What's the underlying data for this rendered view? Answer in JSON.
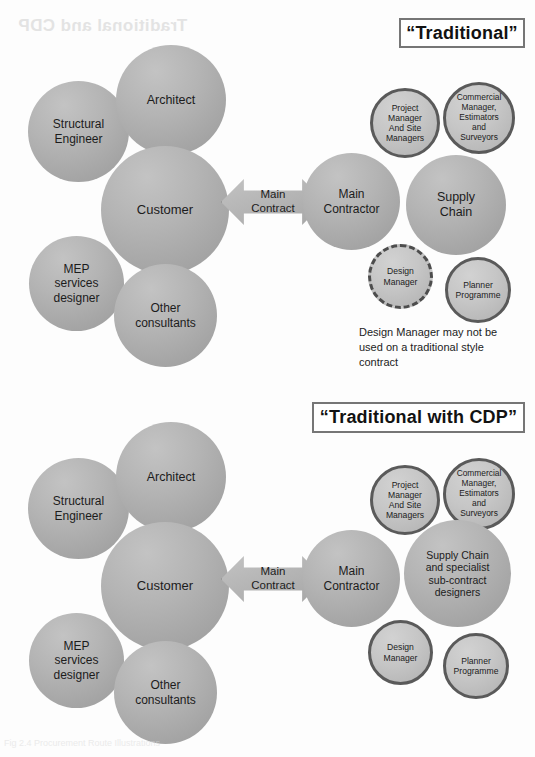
{
  "page": {
    "ghost_top": "Traditional and CDP",
    "ghost_bottom": "Fig 2.4  Procurement Route Illustrations"
  },
  "diagrams": [
    {
      "id": "traditional",
      "title": "“Traditional”",
      "arrow_label": "Main\nContract",
      "footnote": "Design Manager may not be\nused on a traditional style\ncontract",
      "client_side": [
        {
          "name": "structural-engineer",
          "label": "Structural\nEngineer"
        },
        {
          "name": "architect",
          "label": "Architect"
        },
        {
          "name": "customer",
          "label": "Customer"
        },
        {
          "name": "mep-services-designer",
          "label": "MEP\nservices\ndesigner"
        },
        {
          "name": "other-consultants",
          "label": "Other\nconsultants"
        }
      ],
      "contractor_side": [
        {
          "name": "project-manager-and-site-managers",
          "label": "Project\nManager\nAnd Site\nManagers"
        },
        {
          "name": "commercial-manager-estimators-and-surveyors",
          "label": "Commercial\nManager,\nEstimators\nand\nSurveyors"
        },
        {
          "name": "main-contractor",
          "label": "Main\nContractor"
        },
        {
          "name": "supply-chain",
          "label": "Supply\nChain"
        },
        {
          "name": "design-manager",
          "label": "Design\nManager"
        },
        {
          "name": "planner-programme",
          "label": "Planner\nProgramme"
        }
      ]
    },
    {
      "id": "cdp",
      "title": "“Traditional with CDP”",
      "arrow_label": "Main\nContract",
      "footnote": "",
      "client_side": [
        {
          "name": "structural-engineer",
          "label": "Structural\nEngineer"
        },
        {
          "name": "architect",
          "label": "Architect"
        },
        {
          "name": "customer",
          "label": "Customer"
        },
        {
          "name": "mep-services-designer",
          "label": "MEP\nservices\ndesigner"
        },
        {
          "name": "other-consultants",
          "label": "Other\nconsultants"
        }
      ],
      "contractor_side": [
        {
          "name": "project-manager-and-site-managers",
          "label": "Project\nManager\nAnd Site\nManagers"
        },
        {
          "name": "commercial-manager-estimators-and-surveyors",
          "label": "Commercial\nManager,\nEstimators\nand\nSurveyors"
        },
        {
          "name": "main-contractor",
          "label": "Main\nContractor"
        },
        {
          "name": "supply-chain-and-specialist-sub-contract-designers",
          "label": "Supply Chain\nand specialist\nsub-contract\ndesigners"
        },
        {
          "name": "design-manager",
          "label": "Design\nManager"
        },
        {
          "name": "planner-programme",
          "label": "Planner\nProgramme"
        }
      ]
    }
  ],
  "colors": {
    "node_fill": "#b2b2b2",
    "node_fill_light": "#c6c6c6",
    "node_stroke": "#5a5a5a",
    "title_border": "#767676",
    "text": "#1c1c1c",
    "page_background": "#fdfdfd"
  }
}
